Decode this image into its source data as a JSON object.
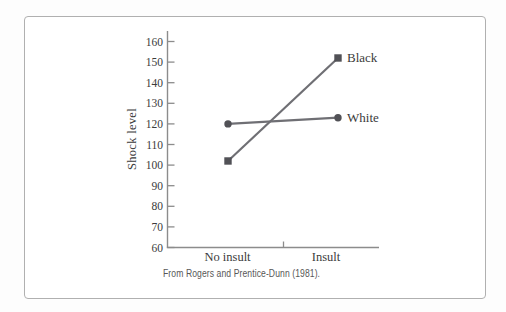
{
  "figure": {
    "caption": "From Rogers and Prentice-Dunn (1981)."
  },
  "chart_data": {
    "type": "line",
    "title": "",
    "xlabel": "",
    "ylabel": "Shock level",
    "categories": [
      "No insult",
      "Insult"
    ],
    "ylim": [
      60,
      160
    ],
    "yticks": [
      160,
      150,
      140,
      130,
      120,
      110,
      100,
      90,
      80,
      70,
      60
    ],
    "grid": false,
    "legend_position": "labels-at-line-ends",
    "series": [
      {
        "name": "Black",
        "marker": "square",
        "values": [
          102,
          152
        ]
      },
      {
        "name": "White",
        "marker": "circle",
        "values": [
          120,
          123
        ]
      }
    ],
    "colors": {
      "line": "#6f6f74",
      "marker": "#515156",
      "axis": "#8c8c8c",
      "text": "#3b3b3b",
      "caption_text": "#575757",
      "frame_border": "#b0b0b0"
    }
  }
}
